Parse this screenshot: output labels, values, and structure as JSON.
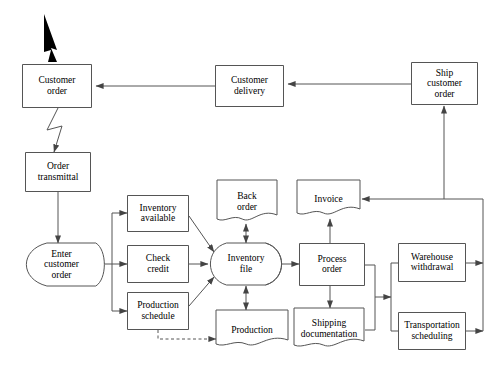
{
  "diagram": {
    "stroke_color": "#555555",
    "text_color": "#000000",
    "background": "#ffffff",
    "nodes": [
      {
        "id": "customer_order",
        "label": "Customer\norder",
        "shape": "process",
        "x": 22,
        "y": 64,
        "w": 70,
        "h": 44,
        "font": 9.5
      },
      {
        "id": "customer_delivery",
        "label": "Customer\ndelivery",
        "shape": "process",
        "x": 215,
        "y": 65,
        "w": 69,
        "h": 42,
        "font": 9.5
      },
      {
        "id": "ship_customer_order",
        "label": "Ship\ncustomer\norder",
        "shape": "process",
        "x": 411,
        "y": 62,
        "w": 67,
        "h": 43,
        "font": 9.5
      },
      {
        "id": "order_transmittal",
        "label": "Order\ntransmittal",
        "shape": "process",
        "x": 25,
        "y": 152,
        "w": 66,
        "h": 40,
        "font": 9.5
      },
      {
        "id": "enter_customer_order",
        "label": "Enter\ncustomer\norder",
        "shape": "manual",
        "x": 25,
        "y": 243,
        "w": 73,
        "h": 43,
        "font": 9.5
      },
      {
        "id": "inventory_available",
        "label": "Inventory\navailable",
        "shape": "process",
        "x": 127,
        "y": 195,
        "w": 62,
        "h": 37,
        "font": 9.5
      },
      {
        "id": "check_credit",
        "label": "Check\ncredit",
        "shape": "process",
        "x": 127,
        "y": 245,
        "w": 62,
        "h": 38,
        "font": 9.5
      },
      {
        "id": "production_schedule",
        "label": "Production\nschedule",
        "shape": "process",
        "x": 127,
        "y": 292,
        "w": 62,
        "h": 38,
        "font": 9.5
      },
      {
        "id": "back_order",
        "label": "Back\norder",
        "shape": "document",
        "x": 217,
        "y": 180,
        "w": 60,
        "h": 44,
        "font": 9.5
      },
      {
        "id": "invoice",
        "label": "Invoice",
        "shape": "document",
        "x": 297,
        "y": 180,
        "w": 63,
        "h": 38,
        "font": 9.5
      },
      {
        "id": "inventory_file",
        "label": "Inventory\nfile",
        "shape": "stored",
        "x": 210,
        "y": 243,
        "w": 72,
        "h": 42,
        "font": 9.5
      },
      {
        "id": "process_order",
        "label": "Process\norder",
        "shape": "process",
        "x": 299,
        "y": 243,
        "w": 66,
        "h": 43,
        "font": 9.5
      },
      {
        "id": "production",
        "label": "Production",
        "shape": "document",
        "x": 216,
        "y": 310,
        "w": 72,
        "h": 39,
        "font": 9.5
      },
      {
        "id": "shipping_documentation",
        "label": "Shipping\ndocumentation",
        "shape": "document",
        "x": 294,
        "y": 308,
        "w": 70,
        "h": 42,
        "font": 9.5
      },
      {
        "id": "warehouse_withdrawal",
        "label": "Warehouse\nwithdrawal",
        "shape": "process",
        "x": 398,
        "y": 243,
        "w": 68,
        "h": 39,
        "font": 9.5
      },
      {
        "id": "transportation_sched",
        "label": "Transportation\nscheduling",
        "shape": "process",
        "x": 398,
        "y": 312,
        "w": 68,
        "h": 38,
        "font": 9.5
      }
    ],
    "connectors": [
      {
        "id": "input-arrow-to-customer-order",
        "type": "bold-arrow",
        "points": "44,14 57,50 51,48 57,62 48,62 51,50 44,52",
        "style": "filled"
      },
      {
        "id": "customer-delivery-to-customer-order",
        "type": "arrow",
        "points": "215,86 96,86"
      },
      {
        "id": "ship-order-to-customer-delivery",
        "type": "arrow",
        "points": "411,84 288,84"
      },
      {
        "id": "customer-order-to-order-transmittal",
        "type": "zigzag-arrow",
        "points": "58,108 47,130 62,126 54,152"
      },
      {
        "id": "order-transmittal-to-enter-order",
        "type": "arrow",
        "points": "58,192 58,243"
      },
      {
        "id": "enter-order-to-branch",
        "type": "line",
        "points": "98,264 112,264"
      },
      {
        "id": "branch-trunk",
        "type": "line",
        "points": "112,213 112,311"
      },
      {
        "id": "branch-to-inventory-available",
        "type": "arrow",
        "points": "112,213 127,213"
      },
      {
        "id": "branch-to-check-credit",
        "type": "arrow",
        "points": "112,264 127,264"
      },
      {
        "id": "branch-to-production-schedule",
        "type": "arrow",
        "points": "112,311 127,311"
      },
      {
        "id": "inventory-available-to-file",
        "type": "arrow",
        "points": "189,216 214,252"
      },
      {
        "id": "check-credit-to-file",
        "type": "arrow",
        "points": "189,264 208,264"
      },
      {
        "id": "production-schedule-to-file",
        "type": "arrow",
        "points": "189,306 214,277"
      },
      {
        "id": "file-to-back-order",
        "type": "arrow-both",
        "points": "246,243 246,224"
      },
      {
        "id": "file-to-production",
        "type": "arrow-both",
        "points": "246,286 246,310"
      },
      {
        "id": "file-to-process-order",
        "type": "arrow",
        "points": "282,264 299,264"
      },
      {
        "id": "process-order-to-invoice",
        "type": "arrow",
        "points": "330,243 330,219"
      },
      {
        "id": "process-order-to-shipping-doc",
        "type": "arrow",
        "points": "330,286 330,308"
      },
      {
        "id": "production-schedule-dashed-production",
        "type": "arrow-dashed",
        "points": "158,330 158,339 216,339"
      },
      {
        "id": "process-order-to-fanout",
        "type": "line",
        "points": "365,265 375,265 375,330 365,330"
      },
      {
        "id": "fanout-to-right-trunk",
        "type": "arrow",
        "points": "375,297 391,297"
      },
      {
        "id": "right-trunk",
        "type": "line",
        "points": "391,263 391,331"
      },
      {
        "id": "trunk-to-warehouse",
        "type": "line",
        "points": "391,263 398,263"
      },
      {
        "id": "trunk-to-transportation",
        "type": "line",
        "points": "391,331 398,331"
      },
      {
        "id": "warehouse-to-return",
        "type": "arrow",
        "points": "466,263 483,263"
      },
      {
        "id": "transportation-to-return",
        "type": "arrow",
        "points": "466,331 483,331"
      },
      {
        "id": "return-trunk",
        "type": "line",
        "points": "483,199 483,331"
      },
      {
        "id": "return-to-invoice",
        "type": "arrow",
        "points": "483,199 362,199"
      },
      {
        "id": "return-to-ship-order",
        "type": "arrow",
        "points": "444,199 444,106"
      }
    ]
  }
}
